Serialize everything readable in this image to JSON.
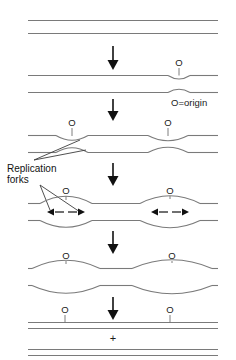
{
  "figure": {
    "legend": "O=origin",
    "callout": {
      "line1": "Replication",
      "line2": "forks"
    },
    "plus_sign": "+",
    "origin_label": "O",
    "arrow_glyph": "↓",
    "colors": {
      "strand": "#7a7a7a",
      "arrow": "#111111",
      "text": "#1a1a1a",
      "leader": "#3c3c3c",
      "background": "#ffffff"
    },
    "stages": [
      {
        "id": "stage-1-unreplicated",
        "name": "unreplicated-duplex",
        "origin_labels": [],
        "bubbles": [],
        "fork_arrows": false,
        "description": "Two parallel strands, no replication bubble"
      },
      {
        "id": "stage-2-initiation",
        "name": "initiation-at-origin",
        "origin_labels": [
          "O"
        ],
        "bubbles": [
          {
            "center_x": 179,
            "half_width": 11,
            "height": 5
          }
        ],
        "fork_arrows": false,
        "description": "Small bubble opens at the origin"
      },
      {
        "id": "stage-3-two-bubbles",
        "name": "early-elongation",
        "origin_labels": [
          "O",
          "O"
        ],
        "bubbles": [
          {
            "center_x": 72,
            "half_width": 16,
            "height": 7
          },
          {
            "center_x": 168,
            "half_width": 20,
            "height": 8
          }
        ],
        "fork_arrows": false,
        "description": "Bubbles enlarge at both origins"
      },
      {
        "id": "stage-4-forks-moving",
        "name": "bidirectional-fork-movement",
        "origin_labels": [
          "O",
          "O"
        ],
        "bubbles": [
          {
            "center_x": 66,
            "half_width": 26,
            "height": 11
          },
          {
            "center_x": 170,
            "half_width": 30,
            "height": 12
          }
        ],
        "fork_arrows": true,
        "description": "Replication forks move bidirectionally away from each origin"
      },
      {
        "id": "stage-5-large-bubbles",
        "name": "late-elongation",
        "origin_labels": [
          "O",
          "O"
        ],
        "bubbles": [
          {
            "center_x": 66,
            "half_width": 34,
            "height": 13
          },
          {
            "center_x": 172,
            "half_width": 40,
            "height": 14
          }
        ],
        "fork_arrows": false,
        "description": "Bubbles nearly fill the molecule"
      },
      {
        "id": "stage-6-separated",
        "name": "two-daughter-duplexes",
        "origin_labels": [
          "O",
          "O"
        ],
        "bubbles": [],
        "fork_arrows": false,
        "description": "Two completed daughter duplexes separated by a plus sign"
      }
    ],
    "stage_arrows": [
      {
        "id": "arrow-1",
        "from": "stage-1-unreplicated",
        "to": "stage-2-initiation"
      },
      {
        "id": "arrow-2",
        "from": "stage-2-initiation",
        "to": "stage-3-two-bubbles"
      },
      {
        "id": "arrow-3",
        "from": "stage-3-two-bubbles",
        "to": "stage-4-forks-moving"
      },
      {
        "id": "arrow-4",
        "from": "stage-4-forks-moving",
        "to": "stage-5-large-bubbles"
      },
      {
        "id": "arrow-5",
        "from": "stage-5-large-bubbles",
        "to": "stage-6-separated"
      }
    ]
  }
}
